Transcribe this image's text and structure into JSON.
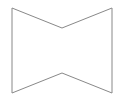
{
  "figure": {
    "name": "concave-hexagon-bowtie",
    "width": 124,
    "height": 101,
    "background_color": "#ffffff",
    "stroke_color": "#888888",
    "stroke_width": 1,
    "fill_color": "none",
    "vertices": [
      {
        "label": "top-left",
        "x": 12,
        "y": 8
      },
      {
        "label": "top-notch",
        "x": 62,
        "y": 28
      },
      {
        "label": "top-right",
        "x": 112,
        "y": 8
      },
      {
        "label": "bottom-right",
        "x": 112,
        "y": 93
      },
      {
        "label": "bottom-notch",
        "x": 62,
        "y": 73
      },
      {
        "label": "bottom-left",
        "x": 12,
        "y": 93
      }
    ],
    "points_attr": "12,8 62,28 112,8 112,93 62,73 12,93"
  }
}
